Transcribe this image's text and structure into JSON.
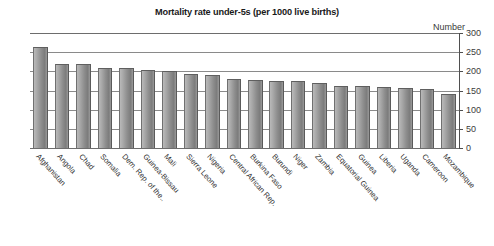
{
  "chart_data": {
    "type": "bar",
    "title": "Mortality rate under-5s (per 1000 live births)",
    "xlabel": "",
    "ylabel": "Number",
    "ylim": [
      0,
      300
    ],
    "yticks": [
      300,
      250,
      200,
      150,
      100,
      50,
      0
    ],
    "grid": true,
    "legend": "none",
    "axis_position": "right",
    "categories": [
      "Afghanistan",
      "Angola",
      "Chad",
      "Somalia",
      "Dem. Rep. of the..",
      "Guinea-Bissau",
      "Mali",
      "Sierra Leone",
      "Nigeria",
      "Central African Rep.",
      "Burkina Faso",
      "Burundi",
      "Niger",
      "Zambia",
      "Equatorial Guinea",
      "Guinea",
      "Liberia",
      "Uganda",
      "Cameroon",
      "Mozambique"
    ],
    "values": [
      263,
      220,
      218,
      209,
      209,
      204,
      202,
      194,
      191,
      179,
      178,
      176,
      176,
      170,
      161,
      161,
      158,
      156,
      154,
      142
    ]
  },
  "axis": {
    "unit_label": "Number"
  }
}
